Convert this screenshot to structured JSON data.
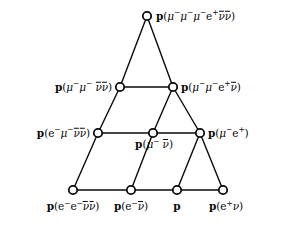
{
  "diagram": {
    "title": "",
    "type": "lattice-graph",
    "background_color": "#ffffff",
    "line_color": "#0a0a0a",
    "node_fill": "#ffffff",
    "node_stroke": "#0a0a0a",
    "nodes": [
      {
        "id": "n0",
        "label_plain": "p(μ⁻μ⁻μ⁻e⁺ν̄ν̄)",
        "x": 147,
        "y": 16,
        "label_position": "right"
      },
      {
        "id": "n1",
        "label_plain": "p(μ⁻μ⁻ν̄ν̄)",
        "x": 120,
        "y": 87,
        "label_position": "left"
      },
      {
        "id": "n2",
        "label_plain": "p(μ⁻μ⁻e⁺ν̄)",
        "x": 173,
        "y": 87,
        "label_position": "right"
      },
      {
        "id": "n3",
        "label_plain": "p(e⁻μ⁻ν̄ν̄)",
        "x": 98,
        "y": 133,
        "label_position": "left"
      },
      {
        "id": "n4",
        "label_plain": "p(μ⁻ν̄)",
        "x": 153,
        "y": 133,
        "label_position": "below"
      },
      {
        "id": "n5",
        "label_plain": "p(μ⁻e⁺)",
        "x": 200,
        "y": 133,
        "label_position": "right"
      },
      {
        "id": "n6",
        "label_plain": "p(e⁻e⁻ν̄ν̄)",
        "x": 73,
        "y": 190,
        "label_position": "below"
      },
      {
        "id": "n7",
        "label_plain": "p(e⁻ν̄)",
        "x": 131,
        "y": 190,
        "label_position": "below"
      },
      {
        "id": "n8",
        "label_plain": "p",
        "x": 177,
        "y": 190,
        "label_position": "below"
      },
      {
        "id": "n9",
        "label_plain": "p(e⁺ν)",
        "x": 223,
        "y": 190,
        "label_position": "below"
      }
    ],
    "edges": [
      {
        "from": "n0",
        "to": "n1"
      },
      {
        "from": "n0",
        "to": "n2"
      },
      {
        "from": "n1",
        "to": "n2"
      },
      {
        "from": "n1",
        "to": "n3"
      },
      {
        "from": "n2",
        "to": "n4"
      },
      {
        "from": "n2",
        "to": "n5"
      },
      {
        "from": "n3",
        "to": "n4"
      },
      {
        "from": "n4",
        "to": "n5"
      },
      {
        "from": "n3",
        "to": "n6"
      },
      {
        "from": "n4",
        "to": "n7"
      },
      {
        "from": "n5",
        "to": "n8"
      },
      {
        "from": "n5",
        "to": "n9"
      },
      {
        "from": "n6",
        "to": "n7"
      },
      {
        "from": "n7",
        "to": "n8"
      },
      {
        "from": "n8",
        "to": "n9"
      }
    ]
  }
}
